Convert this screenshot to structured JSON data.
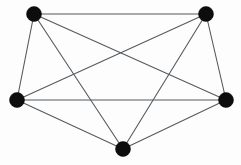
{
  "figure": {
    "width": 241,
    "height": 165,
    "background_color": "#fdfdfd"
  },
  "style": {
    "edge_color": "#555a5e",
    "edge_width": 1.1,
    "vertex_color": "#0d0d0d",
    "vertex_radius": 7.5
  },
  "chart_data": {
    "type": "diagram",
    "graph_type": "undirected",
    "title": "",
    "vertex_count": 5,
    "edge_count": 10,
    "crossing_count": 5,
    "vertices": [
      {
        "id": "v1",
        "label": "top-left",
        "x": 34,
        "y": 14
      },
      {
        "id": "v2",
        "label": "top-right",
        "x": 206,
        "y": 14
      },
      {
        "id": "v3",
        "label": "left",
        "x": 17,
        "y": 100
      },
      {
        "id": "v4",
        "label": "right",
        "x": 226,
        "y": 100
      },
      {
        "id": "v5",
        "label": "bottom",
        "x": 123,
        "y": 149
      }
    ],
    "edges": [
      {
        "from": "v1",
        "to": "v2"
      },
      {
        "from": "v1",
        "to": "v3"
      },
      {
        "from": "v1",
        "to": "v4"
      },
      {
        "from": "v1",
        "to": "v5"
      },
      {
        "from": "v2",
        "to": "v3"
      },
      {
        "from": "v2",
        "to": "v4"
      },
      {
        "from": "v2",
        "to": "v5"
      },
      {
        "from": "v3",
        "to": "v4"
      },
      {
        "from": "v3",
        "to": "v5"
      },
      {
        "from": "v4",
        "to": "v5"
      }
    ],
    "degrees": {
      "v1": 4,
      "v2": 4,
      "v3": 4,
      "v4": 4,
      "v5": 4
    }
  }
}
